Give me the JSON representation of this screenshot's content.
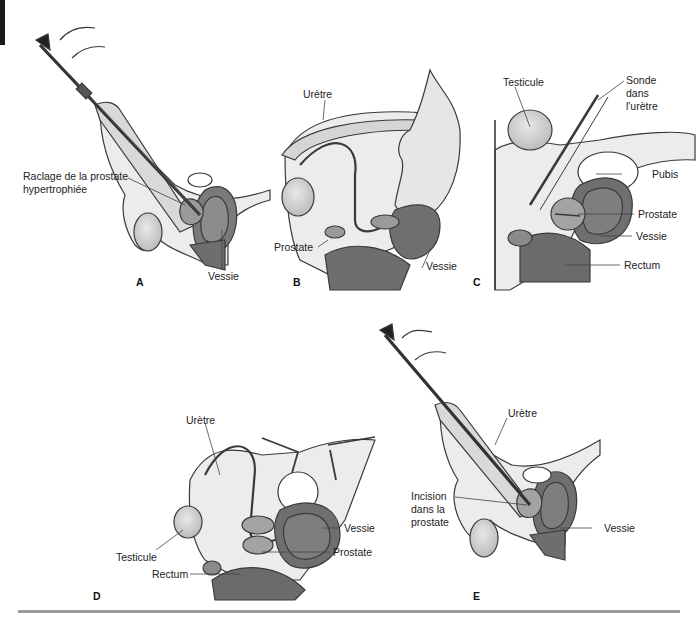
{
  "figure": {
    "panels": [
      {
        "id": "A",
        "letter": "A",
        "labels": {
          "scraping": "Raclage de la prostate",
          "scraping_line2": "hypertrophiée",
          "bladder": "Vessie"
        }
      },
      {
        "id": "B",
        "letter": "B",
        "labels": {
          "urethra": "Urètre",
          "prostate": "Prostate",
          "bladder": "Vessie"
        }
      },
      {
        "id": "C",
        "letter": "C",
        "labels": {
          "testicle": "Testicule",
          "probe_l1": "Sonde",
          "probe_l2": "dans",
          "probe_l3": "l'urètre",
          "pubis": "Pubis",
          "prostate": "Prostate",
          "bladder": "Vessie",
          "rectum": "Rectum"
        }
      },
      {
        "id": "D",
        "letter": "D",
        "labels": {
          "urethra": "Urètre",
          "testicle": "Testicule",
          "rectum": "Rectum",
          "bladder": "Vessie",
          "prostate": "Prostate"
        }
      },
      {
        "id": "E",
        "letter": "E",
        "labels": {
          "urethra": "Urètre",
          "incision_l1": "Incision",
          "incision_l2": "dans la",
          "incision_l3": "prostate",
          "bladder": "Vessie"
        }
      }
    ],
    "colors": {
      "outline": "#3a3a3a",
      "tissue_light": "#ececec",
      "tissue_mid": "#bdbdbd",
      "organ_dark": "#7a7a7a",
      "organ_darker": "#5e5e5e",
      "rule": "#9a9a9a"
    }
  }
}
